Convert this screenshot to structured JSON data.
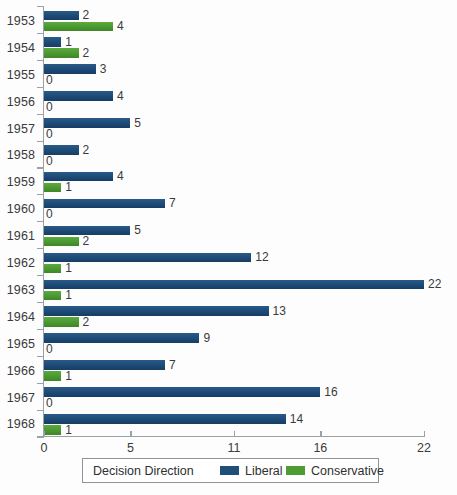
{
  "chart_data": {
    "type": "bar",
    "orientation": "horizontal",
    "title": "",
    "xlabel": "",
    "ylabel": "",
    "xlim": [
      0,
      22
    ],
    "xticks": [
      0,
      5,
      11,
      16,
      22
    ],
    "xtick_labels": [
      "0",
      "5",
      "11",
      "16",
      "22"
    ],
    "grid": false,
    "legend_position": "bottom",
    "legend_title": "Decision Direction",
    "categories": [
      "1953",
      "1954",
      "1955",
      "1956",
      "1957",
      "1958",
      "1959",
      "1960",
      "1961",
      "1962",
      "1963",
      "1964",
      "1965",
      "1966",
      "1967",
      "1968"
    ],
    "series": [
      {
        "name": "Liberal",
        "color": "#1f4e79",
        "values": [
          2,
          1,
          3,
          4,
          5,
          2,
          4,
          7,
          5,
          12,
          22,
          13,
          9,
          7,
          16,
          14
        ]
      },
      {
        "name": "Conservative",
        "color": "#4e9d33",
        "values": [
          4,
          2,
          0,
          0,
          0,
          0,
          1,
          0,
          2,
          1,
          1,
          2,
          0,
          1,
          0,
          1
        ]
      }
    ]
  },
  "legend": {
    "title": "Decision Direction",
    "items": [
      {
        "label": "Liberal",
        "color": "#1f4e79"
      },
      {
        "label": "Conservative",
        "color": "#4e9d33"
      }
    ]
  },
  "axis": {
    "x_tick_labels": [
      "0",
      "5",
      "11",
      "16",
      "22"
    ],
    "x_tick_values": [
      0,
      5,
      11,
      16,
      22
    ]
  }
}
